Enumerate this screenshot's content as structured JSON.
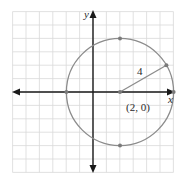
{
  "diagram": {
    "type": "circle-on-coordinate-grid",
    "axes": {
      "x_label": "x",
      "y_label": "y"
    },
    "grid": {
      "x_min": -6,
      "x_max": 6,
      "y_min": -6,
      "y_max": 6,
      "unit": 1
    },
    "circle": {
      "center": [
        2,
        0
      ],
      "radius": 4
    },
    "labels": {
      "center": "(2, 0)",
      "radius": "4"
    },
    "marked_points": [
      [
        2,
        4
      ],
      [
        2,
        -4
      ],
      [
        -2,
        0
      ],
      [
        6,
        0
      ],
      [
        5.46,
        2
      ],
      [
        2,
        0
      ]
    ],
    "colors": {
      "grid": "#d9d9d9",
      "axis": "#1a1a1a",
      "circle": "#8c8c8c",
      "point": "#7a7a7a"
    }
  }
}
